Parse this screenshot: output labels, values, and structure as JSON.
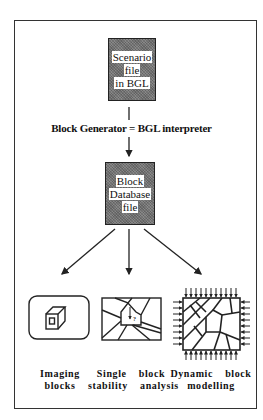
{
  "diagram": {
    "top_box": {
      "lines": [
        "Scenario",
        "file",
        "in BGL"
      ]
    },
    "generator_label": "Block Generator = BGL interpreter",
    "middle_box": {
      "lines": [
        "Block",
        "Database",
        "file"
      ]
    },
    "outputs": [
      {
        "icon": "cube-in-rounded-box-icon",
        "lines": [
          "Imaging",
          "blocks"
        ]
      },
      {
        "icon": "single-block-fracture-icon",
        "lines": [
          "Single  block",
          "stability  analysis"
        ],
        "icon_mark": "?"
      },
      {
        "icon": "block-assembly-under-stress-icon",
        "lines": [
          "Dynamic  block",
          "modelling"
        ]
      }
    ],
    "colors": {
      "box_fill": "#777777",
      "line": "#222222",
      "background": "#ffffff"
    }
  }
}
